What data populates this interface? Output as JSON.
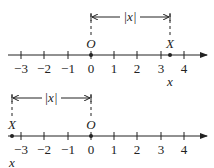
{
  "diagram": {
    "top": {
      "tick_labels": [
        "−3",
        "−2",
        "−1",
        "0",
        "1",
        "2",
        "3",
        "4"
      ],
      "origin_label": "O",
      "point_label": "X",
      "coord_label": "x",
      "distance_label": "|x|",
      "point_value": 3.4
    },
    "bottom": {
      "tick_labels": [
        "−3",
        "−2",
        "−1",
        "0",
        "1",
        "2",
        "3",
        "4"
      ],
      "origin_label": "O",
      "point_label": "X",
      "coord_label": "x",
      "distance_label": "|x|",
      "point_value": -3.4
    }
  }
}
